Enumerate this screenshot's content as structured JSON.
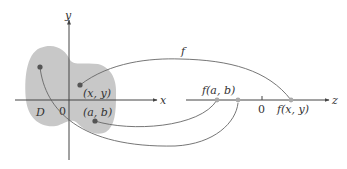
{
  "diagram": {
    "domain_region": {
      "label": "D",
      "fill": "#c8c8c8"
    },
    "xy_plane": {
      "x_axis_label": "x",
      "y_axis_label": "y",
      "origin_label": "0"
    },
    "points": {
      "xy": "(x, y)",
      "ab": "(a, b)"
    },
    "z_axis": {
      "label": "z",
      "origin_label": "0",
      "f_ab": "f(a, b)",
      "f_xy": "f(x, y)"
    },
    "function_label": "f",
    "colors": {
      "axis": "#444444",
      "region": "#c8c8c8",
      "point_domain": "#555555",
      "point_range": "#aaaaaa",
      "curve": "#666666"
    }
  }
}
